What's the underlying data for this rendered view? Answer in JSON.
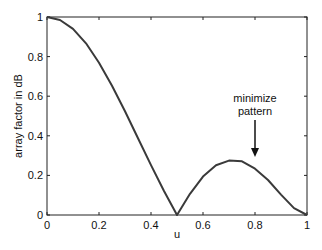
{
  "chart_data": {
    "type": "line",
    "title": "",
    "xlabel": "u",
    "ylabel": "array factor in dB",
    "xlim": [
      0,
      1
    ],
    "ylim": [
      0,
      1
    ],
    "grid": false,
    "legend": null,
    "xticks": [
      "0",
      "0.2",
      "0.4",
      "0.6",
      "0.8",
      "1"
    ],
    "yticks": [
      "0",
      "0.2",
      "0.4",
      "0.6",
      "0.8",
      "1"
    ],
    "series": [
      {
        "name": "array factor",
        "color": "#3a3a3a",
        "x": [
          0,
          0.05,
          0.1,
          0.15,
          0.2,
          0.25,
          0.3,
          0.35,
          0.4,
          0.45,
          0.5,
          0.55,
          0.6,
          0.65,
          0.7,
          0.75,
          0.8,
          0.85,
          0.9,
          0.95,
          1.0
        ],
        "y": [
          1.0,
          0.985,
          0.94,
          0.867,
          0.769,
          0.653,
          0.524,
          0.388,
          0.252,
          0.121,
          0.0,
          0.107,
          0.194,
          0.251,
          0.275,
          0.271,
          0.234,
          0.177,
          0.103,
          0.035,
          0.0
        ]
      }
    ],
    "annotations": [
      {
        "text_lines": [
          "minimize",
          "pattern"
        ],
        "arrow_to": {
          "x": 0.8,
          "y": 0.3
        },
        "arrow_from": {
          "x": 0.8,
          "y": 0.47
        }
      }
    ]
  }
}
